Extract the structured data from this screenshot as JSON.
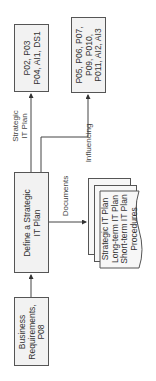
{
  "diagram": {
    "nodes": {
      "po_group_1": {
        "label": "P02, P03\nP04, AI1, DS1"
      },
      "po_group_2": {
        "label": "P05, P06, P07,\nP09, P010,\nP011, AI2, AI3"
      },
      "define_plan": {
        "label": "Define a Strategic\nIT Plan"
      },
      "business_requirements": {
        "label": "Business\nRequirements,\nP08"
      },
      "documents_stack": {
        "label": "Strategic IT Plan\nLong-term IT Plan\nShort-term IT Plan\nProcedures"
      }
    },
    "edge_labels": {
      "strategic_it_plan": "Strategic\nIT Plan",
      "influencing": "Influencing",
      "documents": "Documents"
    },
    "colors": {
      "box_fill": "#f2f2f2",
      "stroke": "#555555"
    }
  }
}
